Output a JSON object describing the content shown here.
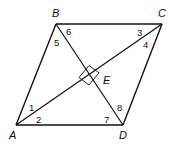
{
  "diagram": {
    "type": "rhombus-with-diagonals",
    "stroke_color": "#111111",
    "vertices": {
      "A": {
        "label": "A",
        "x": 16,
        "y": 125
      },
      "B": {
        "label": "B",
        "x": 56,
        "y": 24
      },
      "C": {
        "label": "C",
        "x": 162,
        "y": 24
      },
      "D": {
        "label": "D",
        "x": 123,
        "y": 125
      },
      "E": {
        "label": "E",
        "x": 89,
        "y": 75
      }
    },
    "segments": [
      "AB",
      "BC",
      "CD",
      "DA",
      "AC",
      "BD"
    ],
    "right_angle_marker_at": "E",
    "angles": [
      {
        "label": "1"
      },
      {
        "label": "2"
      },
      {
        "label": "3"
      },
      {
        "label": "4"
      },
      {
        "label": "5"
      },
      {
        "label": "6"
      },
      {
        "label": "7"
      },
      {
        "label": "8"
      }
    ]
  }
}
